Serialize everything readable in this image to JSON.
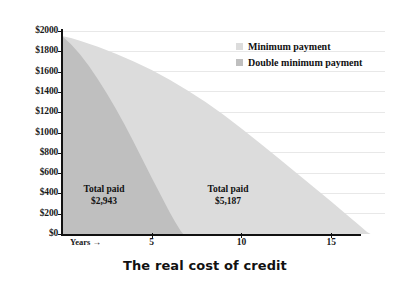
{
  "chart_data": {
    "type": "area",
    "title": "The real cost of credit",
    "xlabel": "Years →",
    "ylabel": "",
    "xlim": [
      0,
      18
    ],
    "ylim": [
      0,
      2000
    ],
    "grid": true,
    "legend_position": "top-right",
    "y_ticks": [
      "$2000",
      "$1800",
      "$1600",
      "$1400",
      "$1200",
      "$1000",
      "$800",
      "$600",
      "$400",
      "$200",
      "$0"
    ],
    "y_tick_values": [
      2000,
      1800,
      1600,
      1400,
      1200,
      1000,
      800,
      600,
      400,
      200,
      0
    ],
    "x_ticks": [
      "5",
      "10",
      "15"
    ],
    "x_tick_values": [
      5,
      10,
      15
    ],
    "series": [
      {
        "name": "Minimum payment",
        "color": "#dcdcdc",
        "total_paid": "$5,187",
        "x": [
          0,
          0.5,
          1,
          2,
          3,
          4,
          5,
          6,
          7,
          8,
          9,
          10,
          11,
          12,
          13,
          14,
          15,
          16,
          16.5,
          17,
          17.2
        ],
        "values": [
          1950,
          1930,
          1905,
          1845,
          1775,
          1700,
          1615,
          1520,
          1415,
          1300,
          1175,
          1040,
          900,
          755,
          610,
          465,
          320,
          170,
          95,
          20,
          0
        ]
      },
      {
        "name": "Double minimum payment",
        "color": "#bfbfbf",
        "total_paid": "$2,943",
        "x": [
          0,
          0.5,
          1,
          1.5,
          2,
          2.5,
          3,
          3.5,
          4,
          4.5,
          5,
          5.5,
          6,
          6.3,
          6.6,
          6.75
        ],
        "values": [
          1950,
          1870,
          1770,
          1655,
          1525,
          1385,
          1235,
          1075,
          905,
          730,
          555,
          385,
          215,
          120,
          35,
          0
        ]
      }
    ],
    "annotations": [
      {
        "id": "double-minimum-payment",
        "title": "Total paid",
        "value": "$2,943"
      },
      {
        "id": "minimum-payment",
        "title": "Total paid",
        "value": "$5,187"
      }
    ]
  },
  "legend": {
    "items": [
      {
        "label": "Minimum payment",
        "color": "#dcdcdc"
      },
      {
        "label": "Double minimum payment",
        "color": "#bfbfbf"
      }
    ]
  }
}
